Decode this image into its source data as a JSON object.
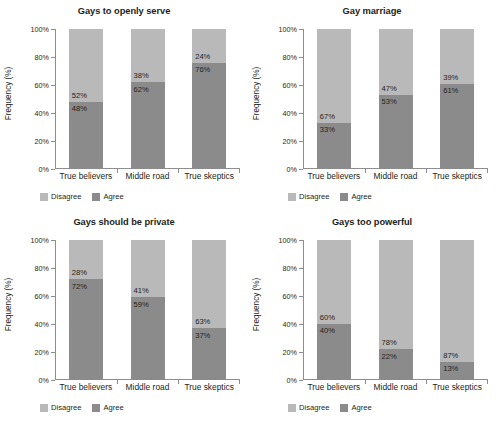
{
  "figure": {
    "layout": "2x2-grid",
    "colors": {
      "disagree": "#b9b9b9",
      "agree": "#8b8b8b",
      "axis": "#8e8e8e",
      "text": "#231f20",
      "background": "#ffffff"
    }
  },
  "common": {
    "ylabel": "Frequency (%)",
    "categories": [
      "True believers",
      "Middle road",
      "True skeptics"
    ],
    "yticks": [
      "0%",
      "20%",
      "40%",
      "60%",
      "80%",
      "100%"
    ],
    "legend": [
      {
        "label": "Disagree",
        "color": "#b9b9b9"
      },
      {
        "label": "Agree",
        "color": "#8b8b8b"
      }
    ]
  },
  "chart_data": [
    {
      "type": "bar",
      "subtype": "100%-stacked",
      "title": "Gays to openly serve",
      "xlabel": "",
      "ylabel": "Frequency (%)",
      "ylim": [
        0,
        100
      ],
      "ytick_values": [
        0,
        20,
        40,
        60,
        80,
        100
      ],
      "ytick_labels": [
        "0%",
        "20%",
        "40%",
        "60%",
        "80%",
        "100%"
      ],
      "grid": false,
      "legend_position": "bottom-left",
      "categories": [
        "True believers",
        "Middle road",
        "True skeptics"
      ],
      "series": [
        {
          "name": "Disagree",
          "color": "#b9b9b9",
          "values": [
            52,
            38,
            24
          ],
          "labels": [
            "52%",
            "38%",
            "24%"
          ]
        },
        {
          "name": "Agree",
          "color": "#8b8b8b",
          "values": [
            48,
            62,
            76
          ],
          "labels": [
            "48%",
            "62%",
            "76%"
          ]
        }
      ]
    },
    {
      "type": "bar",
      "subtype": "100%-stacked",
      "title": "Gay marriage",
      "xlabel": "",
      "ylabel": "Frequency (%)",
      "ylim": [
        0,
        100
      ],
      "ytick_values": [
        0,
        20,
        40,
        60,
        80,
        100
      ],
      "ytick_labels": [
        "0%",
        "20%",
        "40%",
        "60%",
        "80%",
        "100%"
      ],
      "grid": false,
      "legend_position": "bottom-left",
      "categories": [
        "True believers",
        "Middle road",
        "True skeptics"
      ],
      "series": [
        {
          "name": "Disagree",
          "color": "#b9b9b9",
          "values": [
            67,
            47,
            39
          ],
          "labels": [
            "67%",
            "47%",
            "39%"
          ]
        },
        {
          "name": "Agree",
          "color": "#8b8b8b",
          "values": [
            33,
            53,
            61
          ],
          "labels": [
            "33%",
            "53%",
            "61%"
          ]
        }
      ]
    },
    {
      "type": "bar",
      "subtype": "100%-stacked",
      "title": "Gays should be private",
      "xlabel": "",
      "ylabel": "Frequency (%)",
      "ylim": [
        0,
        100
      ],
      "ytick_values": [
        0,
        20,
        40,
        60,
        80,
        100
      ],
      "ytick_labels": [
        "0%",
        "20%",
        "40%",
        "60%",
        "80%",
        "100%"
      ],
      "grid": false,
      "legend_position": "bottom-left",
      "categories": [
        "True believers",
        "Middle road",
        "True skeptics"
      ],
      "series": [
        {
          "name": "Disagree",
          "color": "#b9b9b9",
          "values": [
            28,
            41,
            63
          ],
          "labels": [
            "28%",
            "41%",
            "63%"
          ]
        },
        {
          "name": "Agree",
          "color": "#8b8b8b",
          "values": [
            72,
            59,
            37
          ],
          "labels": [
            "72%",
            "59%",
            "37%"
          ]
        }
      ]
    },
    {
      "type": "bar",
      "subtype": "100%-stacked",
      "title": "Gays too powerful",
      "xlabel": "",
      "ylabel": "Frequency (%)",
      "ylim": [
        0,
        100
      ],
      "ytick_values": [
        0,
        20,
        40,
        60,
        80,
        100
      ],
      "ytick_labels": [
        "0%",
        "20%",
        "40%",
        "60%",
        "80%",
        "100%"
      ],
      "grid": false,
      "legend_position": "bottom-left",
      "categories": [
        "True believers",
        "Middle road",
        "True skeptics"
      ],
      "series": [
        {
          "name": "Disagree",
          "color": "#b9b9b9",
          "values": [
            60,
            78,
            87
          ],
          "labels": [
            "60%",
            "78%",
            "87%"
          ]
        },
        {
          "name": "Agree",
          "color": "#8b8b8b",
          "values": [
            40,
            22,
            13
          ],
          "labels": [
            "40%",
            "22%",
            "13%"
          ]
        }
      ]
    }
  ]
}
